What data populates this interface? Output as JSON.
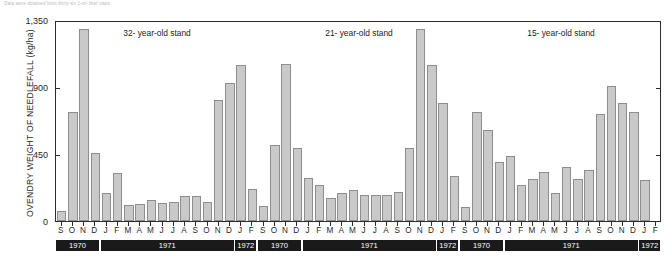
{
  "caption": "Data were obtained from thirty-six 1-m² litter traps.",
  "chart_data": {
    "type": "bar",
    "title": "",
    "xlabel": "",
    "ylabel": "OVENDRY WEIGHT OF NEEDLEFALL (kg/ha)",
    "ylim": [
      0,
      1350
    ],
    "yticks": [
      0,
      450,
      900,
      1350
    ],
    "ytick_labels": [
      "0",
      "450",
      "900",
      "1,350"
    ],
    "right_axis_ticks": [
      450,
      900
    ],
    "grid": false,
    "legend": "none",
    "categories": [
      "S",
      "O",
      "N",
      "D",
      "J",
      "F",
      "M",
      "A",
      "M",
      "J",
      "J",
      "A",
      "S",
      "O",
      "N",
      "D",
      "J",
      "F"
    ],
    "year_groups": [
      {
        "label": "1970",
        "start": 0,
        "span": 4
      },
      {
        "label": "1971",
        "start": 4,
        "span": 12
      },
      {
        "label": "1972",
        "start": 16,
        "span": 2
      }
    ],
    "panels": [
      {
        "name": "32-year-old stand",
        "title": "32- year-old stand",
        "values": [
          65,
          735,
          1290,
          460,
          190,
          320,
          110,
          115,
          140,
          120,
          130,
          165,
          170,
          125,
          810,
          930,
          1045,
          215
        ]
      },
      {
        "name": "21-year-old stand",
        "title": "21- year-old stand",
        "values": [
          100,
          510,
          1055,
          490,
          290,
          240,
          155,
          185,
          205,
          175,
          175,
          175,
          195,
          490,
          1290,
          1045,
          790,
          300
        ]
      },
      {
        "name": "15-year-old stand",
        "title": "15- year-old stand",
        "values": [
          95,
          730,
          610,
          395,
          440,
          245,
          285,
          330,
          185,
          360,
          285,
          340,
          720,
          910,
          790,
          735,
          275,
          0
        ]
      }
    ],
    "units": "kg/ha",
    "series_color": "#c9c9c9",
    "series_edge_color": "#8e8e8e",
    "axis_color": "#2b2b2b",
    "year_bar_color": "#1a1a1a"
  }
}
